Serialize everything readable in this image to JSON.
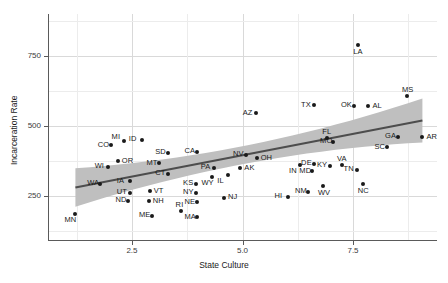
{
  "chart_data": {
    "type": "scatter",
    "title": "",
    "xlabel": "State Culture",
    "ylabel": "Incarceration Rate",
    "xlim": [
      0.6,
      9.4
    ],
    "ylim": [
      90,
      900
    ],
    "xticks": [
      2.5,
      5.0,
      7.5
    ],
    "xtick_labels": [
      "2.5",
      "5.0",
      "7.5"
    ],
    "yticks": [
      250,
      500,
      750
    ],
    "ytick_labels": [
      "250",
      "500",
      "750"
    ],
    "grid": true,
    "legend": "none",
    "point_color": "#1a1a1a",
    "fit_line_color": "#4d4d4d",
    "ribbon_color": "#bfbfbf",
    "panel_color": "#ffffff",
    "gridline_color": "#d9d9d9",
    "annotation_note": "Each point is labeled with a US state postal abbreviation",
    "fit_line": {
      "x_start": 1.22,
      "x_end": 9.07,
      "y_start": 281,
      "y_end": 520
    },
    "points": [
      {
        "label": "MN",
        "x": 1.22,
        "y": 185
      },
      {
        "label": "WA",
        "x": 1.78,
        "y": 295
      },
      {
        "label": "WI",
        "x": 1.95,
        "y": 355
      },
      {
        "label": "CO",
        "x": 2.02,
        "y": 432
      },
      {
        "label": "MI",
        "x": 2.32,
        "y": 448
      },
      {
        "label": "OR",
        "x": 2.18,
        "y": 375
      },
      {
        "label": "ID",
        "x": 2.72,
        "y": 452
      },
      {
        "label": "IA",
        "x": 2.45,
        "y": 303
      },
      {
        "label": "UT",
        "x": 2.45,
        "y": 262
      },
      {
        "label": "ND",
        "x": 2.42,
        "y": 233
      },
      {
        "label": "MT",
        "x": 3.12,
        "y": 368
      },
      {
        "label": "SD",
        "x": 3.32,
        "y": 405
      },
      {
        "label": "CT",
        "x": 3.32,
        "y": 330
      },
      {
        "label": "VT",
        "x": 2.9,
        "y": 268
      },
      {
        "label": "NH",
        "x": 2.88,
        "y": 232
      },
      {
        "label": "ME",
        "x": 2.95,
        "y": 180
      },
      {
        "label": "CA",
        "x": 3.98,
        "y": 408
      },
      {
        "label": "KS",
        "x": 3.95,
        "y": 295
      },
      {
        "label": "NY",
        "x": 3.95,
        "y": 262
      },
      {
        "label": "NE",
        "x": 3.98,
        "y": 228
      },
      {
        "label": "RI",
        "x": 3.6,
        "y": 198
      },
      {
        "label": "MA",
        "x": 3.98,
        "y": 175
      },
      {
        "label": "PA",
        "x": 4.35,
        "y": 352
      },
      {
        "label": "WY",
        "x": 4.32,
        "y": 318
      },
      {
        "label": "IL",
        "x": 4.68,
        "y": 325
      },
      {
        "label": "NJ",
        "x": 4.58,
        "y": 245
      },
      {
        "label": "AK",
        "x": 4.95,
        "y": 350
      },
      {
        "label": "NV",
        "x": 5.08,
        "y": 398
      },
      {
        "label": "OH",
        "x": 5.32,
        "y": 385
      },
      {
        "label": "AZ",
        "x": 5.3,
        "y": 545
      },
      {
        "label": "IN",
        "x": 6.3,
        "y": 362
      },
      {
        "label": "HI",
        "x": 6.02,
        "y": 248
      },
      {
        "label": "MD",
        "x": 6.58,
        "y": 338
      },
      {
        "label": "DE",
        "x": 6.62,
        "y": 365
      },
      {
        "label": "NM",
        "x": 6.48,
        "y": 265
      },
      {
        "label": "WV",
        "x": 6.82,
        "y": 285
      },
      {
        "label": "TX",
        "x": 6.62,
        "y": 575
      },
      {
        "label": "KY",
        "x": 6.98,
        "y": 358
      },
      {
        "label": "MO",
        "x": 7.05,
        "y": 445
      },
      {
        "label": "FL",
        "x": 6.92,
        "y": 458
      },
      {
        "label": "VA",
        "x": 7.25,
        "y": 360
      },
      {
        "label": "OK",
        "x": 7.52,
        "y": 572
      },
      {
        "label": "AL",
        "x": 7.85,
        "y": 570
      },
      {
        "label": "TN",
        "x": 7.58,
        "y": 345
      },
      {
        "label": "NC",
        "x": 7.72,
        "y": 292
      },
      {
        "label": "LA",
        "x": 7.62,
        "y": 790
      },
      {
        "label": "GA",
        "x": 8.52,
        "y": 462
      },
      {
        "label": "SC",
        "x": 8.28,
        "y": 425
      },
      {
        "label": "MS",
        "x": 8.72,
        "y": 608
      },
      {
        "label": "AR",
        "x": 9.07,
        "y": 460
      }
    ],
    "label_offsets": {
      "MN": "below-left",
      "WA": "left",
      "WI": "left",
      "CO": "left",
      "MI": "above-left",
      "OR": "right",
      "ID": "left",
      "IA": "left",
      "UT": "left",
      "ND": "left",
      "MT": "left",
      "SD": "left",
      "CT": "left",
      "VT": "right",
      "NH": "right",
      "ME": "left",
      "CA": "left",
      "KS": "left",
      "NY": "left",
      "NE": "left",
      "RI": "above",
      "MA": "left",
      "PA": "left",
      "WY": "below-left",
      "IL": "below-left",
      "NJ": "right",
      "AK": "right",
      "NV": "left",
      "OH": "right",
      "AZ": "left",
      "IN": "below-left",
      "HI": "left",
      "MD": "left",
      "DE": "left",
      "NM": "left",
      "WV": "below",
      "TX": "left",
      "KY": "left",
      "MO": "left",
      "FL": "above",
      "VA": "above",
      "OK": "left",
      "AL": "right",
      "TN": "left",
      "NC": "below",
      "LA": "below",
      "GA": "left",
      "SC": "left",
      "MS": "above",
      "AR": "right"
    }
  }
}
